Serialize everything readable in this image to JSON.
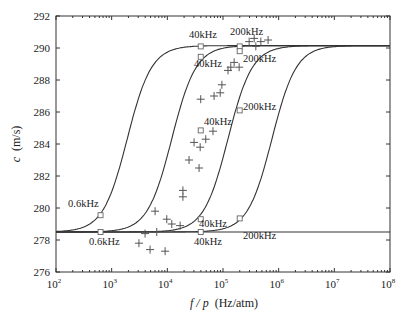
{
  "chart_data": {
    "type": "line",
    "title": "",
    "xlabel": "f / p (Hz/atm)",
    "xlabel_italic": "f / p",
    "xlabel_unit": "(Hz/atm)",
    "ylabel": "c (m/s)",
    "ylabel_italic": "c",
    "ylabel_unit": "(m/s)",
    "xscale": "log",
    "xlim": [
      100,
      100000000
    ],
    "ylim": [
      276,
      292
    ],
    "x_ticks": [
      {
        "exp": 2,
        "label": "10",
        "sup": "2"
      },
      {
        "exp": 3,
        "label": "10",
        "sup": "3"
      },
      {
        "exp": 4,
        "label": "10",
        "sup": "4"
      },
      {
        "exp": 5,
        "label": "10",
        "sup": "5"
      },
      {
        "exp": 6,
        "label": "10",
        "sup": "6"
      },
      {
        "exp": 7,
        "label": "10",
        "sup": "7"
      },
      {
        "exp": 8,
        "label": "10",
        "sup": "8"
      }
    ],
    "y_ticks": [
      276,
      278,
      280,
      282,
      284,
      286,
      288,
      290,
      292
    ],
    "grid": false,
    "legend": null,
    "curve_model": {
      "c_low": 278.5,
      "c_high": 290.15,
      "slope": 2.0
    },
    "series": [
      {
        "name": "dispersion curve 1",
        "kind": "line",
        "log10_f_mid": 3.28
      },
      {
        "name": "dispersion curve 2",
        "kind": "line",
        "log10_f_mid": 4.08
      },
      {
        "name": "dispersion curve 3",
        "kind": "line",
        "log10_f_mid": 5.09
      },
      {
        "name": "dispersion curve 4",
        "kind": "line",
        "log10_f_mid": 5.88
      },
      {
        "name": "baseline",
        "kind": "line",
        "c": 278.5
      },
      {
        "name": "measured data",
        "kind": "scatter",
        "marker": "+",
        "points": [
          [
            5.47,
            290.4
          ],
          [
            5.56,
            290.6
          ],
          [
            5.68,
            290.4
          ],
          [
            5.81,
            290.5
          ],
          [
            5.59,
            290.1
          ],
          [
            5.2,
            289.1
          ],
          [
            5.14,
            288.8
          ],
          [
            5.09,
            288.6
          ],
          [
            5.29,
            288.8
          ],
          [
            4.98,
            287.7
          ],
          [
            4.95,
            287.2
          ],
          [
            4.84,
            287.0
          ],
          [
            4.6,
            286.8
          ],
          [
            4.82,
            284.8
          ],
          [
            4.69,
            284.3
          ],
          [
            4.48,
            284.1
          ],
          [
            4.59,
            283.8
          ],
          [
            4.39,
            283.0
          ],
          [
            4.57,
            282.5
          ],
          [
            4.28,
            281.1
          ],
          [
            4.28,
            280.7
          ],
          [
            3.78,
            279.8
          ],
          [
            3.99,
            279.3
          ],
          [
            4.08,
            279.0
          ],
          [
            4.23,
            278.9
          ],
          [
            3.6,
            278.4
          ],
          [
            3.81,
            278.5
          ],
          [
            3.49,
            277.8
          ],
          [
            3.69,
            277.4
          ],
          [
            3.96,
            277.3
          ]
        ],
        "point_format": "[log10(f/p), c]"
      },
      {
        "name": "frequency markers",
        "kind": "scatter",
        "marker": "square",
        "points": [
          [
            2.8,
            279.55
          ],
          [
            2.8,
            278.5
          ],
          [
            4.6,
            290.1
          ],
          [
            4.6,
            289.45
          ],
          [
            4.6,
            284.85
          ],
          [
            4.6,
            279.3
          ],
          [
            4.6,
            278.5
          ],
          [
            5.3,
            290.1
          ],
          [
            5.3,
            289.8
          ],
          [
            5.3,
            286.1
          ],
          [
            5.3,
            279.35
          ]
        ],
        "point_format": "[log10(f/p), c]"
      }
    ],
    "annotations": [
      {
        "text": "0.6kHz",
        "x": 68,
        "y": 207
      },
      {
        "text": "0.6kHz",
        "x": 89,
        "y": 245
      },
      {
        "text": "40kHz",
        "x": 189,
        "y": 38
      },
      {
        "text": "40kHz",
        "x": 194,
        "y": 67
      },
      {
        "text": "40kHz",
        "x": 204,
        "y": 125
      },
      {
        "text": "40kHz",
        "x": 199,
        "y": 227
      },
      {
        "text": "40kHz",
        "x": 194,
        "y": 245
      },
      {
        "text": "200kHz",
        "x": 230,
        "y": 35
      },
      {
        "text": "200kHz",
        "x": 243,
        "y": 62
      },
      {
        "text": "200kHz",
        "x": 243,
        "y": 110
      },
      {
        "text": "200kHz",
        "x": 243,
        "y": 239
      }
    ]
  }
}
